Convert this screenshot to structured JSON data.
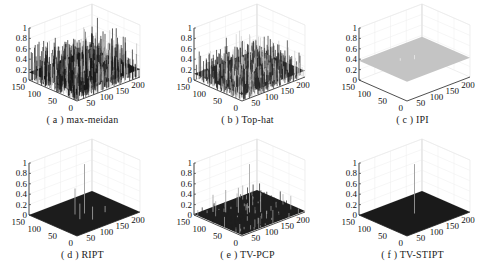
{
  "chart_data": [
    {
      "id": "a",
      "type": "surface3d",
      "title": "( a ) max-meidan",
      "caption": "( a ) max-meidan",
      "xlim": [
        0,
        200
      ],
      "ylim": [
        0,
        150
      ],
      "zlim": [
        0,
        1
      ],
      "xticks": [
        "50",
        "100",
        "150",
        "200"
      ],
      "yticks": [
        "0",
        "50",
        "100",
        "150"
      ],
      "zticks": [
        "0",
        "0.2",
        "0.4",
        "0.6",
        "0.8",
        "1"
      ],
      "surface": {
        "style": "noise",
        "base": 0.15,
        "amplitude": 0.45,
        "color": "#1a1a1a",
        "highlight": "#bdbdbd"
      },
      "peaks": [
        {
          "x": 100,
          "y": 75,
          "z": 0.95
        }
      ]
    },
    {
      "id": "b",
      "type": "surface3d",
      "title": "( b ) Top-hat",
      "caption": "( b ) Top-hat",
      "xlim": [
        0,
        200
      ],
      "ylim": [
        0,
        150
      ],
      "zlim": [
        0,
        1
      ],
      "xticks": [
        "50",
        "100",
        "150",
        "200"
      ],
      "yticks": [
        "0",
        "50",
        "100",
        "150"
      ],
      "zticks": [
        "0",
        "0.2",
        "0.4",
        "0.6",
        "0.8",
        "1"
      ],
      "surface": {
        "style": "noise",
        "base": 0.12,
        "amplitude": 0.35,
        "color": "#2a2a2a",
        "highlight": "#cfcfcf"
      },
      "peaks": [
        {
          "x": 100,
          "y": 75,
          "z": 0.85
        }
      ]
    },
    {
      "id": "c",
      "type": "surface3d",
      "title": "( c ) IPI",
      "caption": "( c ) IPI",
      "xlim": [
        0,
        200
      ],
      "ylim": [
        0,
        150
      ],
      "zlim": [
        0,
        1
      ],
      "xticks": [
        "50",
        "100",
        "150",
        "200"
      ],
      "yticks": [
        "0",
        "50",
        "100",
        "150"
      ],
      "zticks": [
        "0",
        "0.2",
        "0.4",
        "0.6",
        "0.8",
        "1"
      ],
      "surface": {
        "style": "flat",
        "base": 0.37,
        "amplitude": 0.0,
        "color": "#c4c4c4",
        "highlight": "#e6e6e6"
      },
      "peaks": [
        {
          "x": 100,
          "y": 75,
          "z": 0.45
        },
        {
          "x": 70,
          "y": 90,
          "z": 0.42
        }
      ]
    },
    {
      "id": "d",
      "type": "surface3d",
      "title": "( d ) RIPT",
      "caption": "( d ) RIPT",
      "xlim": [
        0,
        200
      ],
      "ylim": [
        0,
        150
      ],
      "zlim": [
        0,
        1
      ],
      "xticks": [
        "50",
        "100",
        "150",
        "200"
      ],
      "yticks": [
        "0",
        "50",
        "100",
        "150"
      ],
      "zticks": [
        "0",
        "0.2",
        "0.4",
        "0.6",
        "0.8",
        "1"
      ],
      "surface": {
        "style": "flat",
        "base": 0.0,
        "amplitude": 0.0,
        "color": "#1c1c1c",
        "highlight": "#9a9a9a"
      },
      "peaks": [
        {
          "x": 100,
          "y": 75,
          "z": 0.95
        },
        {
          "x": 80,
          "y": 85,
          "z": 0.5
        },
        {
          "x": 70,
          "y": 60,
          "z": 0.3
        },
        {
          "x": 90,
          "y": 40,
          "z": 0.25
        },
        {
          "x": 140,
          "y": 50,
          "z": 0.12
        }
      ]
    },
    {
      "id": "e",
      "type": "surface3d",
      "title": "( e ) TV-PCP",
      "caption": "( e ) TV-PCP",
      "xlim": [
        0,
        200
      ],
      "ylim": [
        0,
        150
      ],
      "zlim": [
        0,
        1
      ],
      "xticks": [
        "50",
        "100",
        "150",
        "200"
      ],
      "yticks": [
        "0",
        "50",
        "100",
        "150"
      ],
      "zticks": [
        "0",
        "0.2",
        "0.4",
        "0.6",
        "0.8",
        "1"
      ],
      "surface": {
        "style": "sparse",
        "base": 0.02,
        "amplitude": 0.3,
        "color": "#1e1e1e",
        "highlight": "#a8a8a8"
      },
      "peaks": [
        {
          "x": 100,
          "y": 75,
          "z": 0.95
        },
        {
          "x": 60,
          "y": 110,
          "z": 0.45
        },
        {
          "x": 120,
          "y": 60,
          "z": 0.4
        },
        {
          "x": 40,
          "y": 130,
          "z": 0.35
        },
        {
          "x": 80,
          "y": 90,
          "z": 0.5
        }
      ]
    },
    {
      "id": "f",
      "type": "surface3d",
      "title": "( f ) TV-STIPT",
      "caption": "( f ) TV-STIPT",
      "xlim": [
        0,
        200
      ],
      "ylim": [
        0,
        150
      ],
      "zlim": [
        0,
        1
      ],
      "xticks": [
        "50",
        "100",
        "150",
        "200"
      ],
      "yticks": [
        "0",
        "50",
        "100",
        "150"
      ],
      "zticks": [
        "0",
        "0.2",
        "0.4",
        "0.6",
        "0.8",
        "1"
      ],
      "surface": {
        "style": "flat",
        "base": 0.0,
        "amplitude": 0.0,
        "color": "#1a1a1a",
        "highlight": "#9a9a9a"
      },
      "peaks": [
        {
          "x": 100,
          "y": 75,
          "z": 0.95
        }
      ]
    }
  ],
  "layout": {
    "columns": 3,
    "rows": 2,
    "panel_width": 165,
    "panel_height": 135
  }
}
